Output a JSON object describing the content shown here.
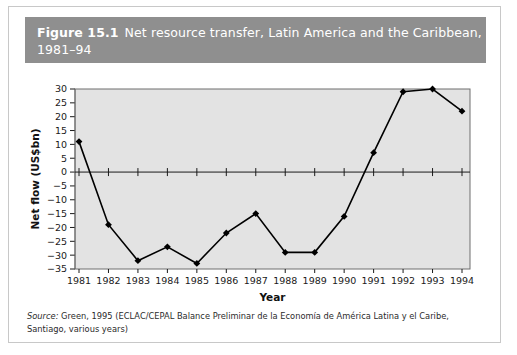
{
  "figure": {
    "number": "Figure 15.1",
    "title_line1": "Net resource transfer, Latin America and the Caribbean,",
    "title_line2": "1981–94",
    "title_bar_color": "#8f8f8f",
    "title_text_color": "#ffffff"
  },
  "source": {
    "label": "Source:",
    "text": " Green, 1995 (ECLAC/CEPAL Balance Preliminar de la Economía de América Latina y el Caribe, Santiago, various years)"
  },
  "chart_data": {
    "type": "line",
    "title": "Net resource transfer, Latin America and the Caribbean, 1981–94",
    "xlabel": "Year",
    "ylabel": "Net flow (US$bn)",
    "categories": [
      "1981",
      "1982",
      "1983",
      "1984",
      "1985",
      "1986",
      "1987",
      "1988",
      "1989",
      "1990",
      "1991",
      "1992",
      "1993",
      "1994"
    ],
    "values": [
      11,
      -19,
      -32,
      -27,
      -33,
      -22,
      -15,
      -29,
      -29,
      -16,
      7,
      29,
      30,
      22
    ],
    "ylim": [
      -35,
      30
    ],
    "yticks": [
      30,
      25,
      20,
      15,
      10,
      5,
      0,
      -5,
      -10,
      -15,
      -20,
      -25,
      -30,
      -35
    ],
    "ytick_labels": [
      "30",
      "25",
      "20",
      "15",
      "10",
      "5",
      "0",
      "−5",
      "−10",
      "−15",
      "−20",
      "−25",
      "−30",
      "−35"
    ],
    "xticks": [
      "1981",
      "1982",
      "1983",
      "1984",
      "1985",
      "1986",
      "1987",
      "1988",
      "1989",
      "1990",
      "1991",
      "1992",
      "1993",
      "1994"
    ],
    "grid": false,
    "legend": null,
    "plot_background": "#e3e3e3",
    "line_color": "#000000",
    "marker": "diamond",
    "marker_color": "#000000",
    "zero_line": 0
  }
}
